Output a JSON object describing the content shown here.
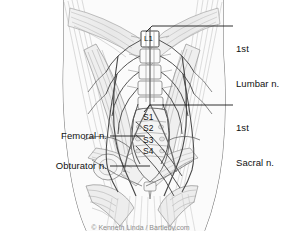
{
  "figure": {
    "kind": "anatomical-line-illustration",
    "background_color": "#ffffff",
    "ink_color": "#555555",
    "label_color": "#111111",
    "leader_color": "#1a1a1a"
  },
  "callouts": {
    "right": [
      {
        "id": "first-lumbar-nerve",
        "line1": "1st",
        "line2": "Lumbar n.",
        "text_x": 236,
        "text_y": 22,
        "leader_from_x": 152,
        "leader_from_y": 26,
        "leader_to_x": 233,
        "leader_to_y": 26
      },
      {
        "id": "first-sacral-nerve",
        "line1": "1st",
        "line2": "Sacral n.",
        "text_x": 236,
        "text_y": 97,
        "leader_from_x": 150,
        "leader_from_y": 105,
        "leader_to_x": 233,
        "leader_to_y": 105
      }
    ],
    "left": [
      {
        "id": "femoral-nerve",
        "line1": "Femoral n.",
        "text_right_x": 107,
        "text_y": 131,
        "leader_from_x": 110,
        "leader_from_y": 136,
        "leader_to_x": 145,
        "leader_to_y": 136
      },
      {
        "id": "obturator-nerve",
        "line1": "Obturator n.",
        "text_right_x": 107,
        "text_y": 161,
        "leader_from_x": 110,
        "leader_from_y": 166,
        "leader_to_x": 150,
        "leader_to_y": 166
      }
    ]
  },
  "vertebral_labels": {
    "lumbar": {
      "text": "L1",
      "x": 144,
      "y": 38
    },
    "sacral": [
      {
        "text": "S1",
        "x": 143,
        "y": 117
      },
      {
        "text": "S2",
        "x": 143,
        "y": 128
      },
      {
        "text": "S3",
        "x": 143,
        "y": 140
      },
      {
        "text": "S4",
        "x": 143,
        "y": 151
      }
    ]
  },
  "bottom_caption": {
    "text": "© Kenneth Linda / Bartleby.com"
  }
}
